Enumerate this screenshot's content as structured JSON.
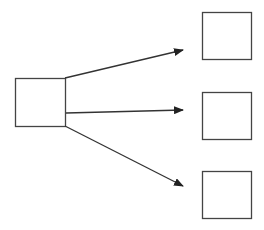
{
  "diagram": {
    "type": "one-to-many flow",
    "stroke_color": "#333333",
    "background": "#ffffff",
    "source_node": {
      "id": "source",
      "label": "",
      "x": 15,
      "y": 78,
      "w": 50,
      "h": 48
    },
    "target_nodes": [
      {
        "id": "target-top",
        "label": "",
        "x": 202,
        "y": 12,
        "w": 49,
        "h": 47
      },
      {
        "id": "target-middle",
        "label": "",
        "x": 202,
        "y": 92,
        "w": 49,
        "h": 47
      },
      {
        "id": "target-bottom",
        "label": "",
        "x": 202,
        "y": 171,
        "w": 49,
        "h": 47
      }
    ],
    "edges": [
      {
        "from": "source",
        "to": "target-top",
        "x1": 65,
        "y1": 78,
        "x2": 183,
        "y2": 50
      },
      {
        "from": "source",
        "to": "target-middle",
        "x1": 66,
        "y1": 113,
        "x2": 183,
        "y2": 110
      },
      {
        "from": "source",
        "to": "target-bottom",
        "x1": 65,
        "y1": 126,
        "x2": 183,
        "y2": 186
      }
    ]
  }
}
